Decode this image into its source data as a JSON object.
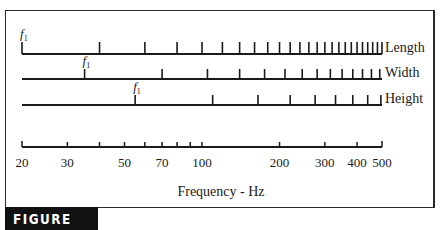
{
  "figure": {
    "badge": "FIGURE 15-21",
    "colors": {
      "ink": "#1a1a1a",
      "badge_bg": "#111111",
      "badge_text": "#ffffff"
    }
  },
  "chart_data": {
    "type": "scatter",
    "title": "",
    "xlabel": "Frequency - Hz",
    "xscale": "log",
    "xlim": [
      20,
      500
    ],
    "x_ticks": [
      20,
      30,
      40,
      50,
      60,
      70,
      80,
      90,
      100,
      200,
      300,
      400,
      500
    ],
    "x_tick_labels": [
      "20",
      "30",
      "50",
      "70",
      "100",
      "200",
      "300",
      "400",
      "500"
    ],
    "fundamental_label": "f1",
    "series": [
      {
        "name": "Length",
        "fundamental_hz": 20,
        "harmonics_up_to_hz": 500
      },
      {
        "name": "Width",
        "fundamental_hz": 35,
        "harmonics_up_to_hz": 500
      },
      {
        "name": "Height",
        "fundamental_hz": 55,
        "harmonics_up_to_hz": 500
      }
    ]
  }
}
